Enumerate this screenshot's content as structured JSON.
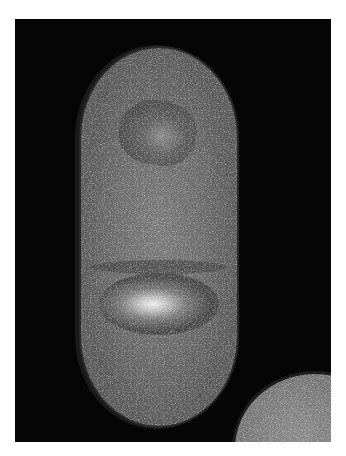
{
  "image": {
    "kind": "grayscale electron micrograph",
    "colors": {
      "border": "#ffffff",
      "background": "#050505",
      "cytoplasm": "#6e6e6e",
      "nucleoid_bright": "#f2f2f2",
      "nucleoid_dark": "#4a4a4a"
    },
    "subjects": [
      {
        "name": "elongated rod-shaped cell",
        "position": "center"
      },
      {
        "name": "partial round cell",
        "position": "bottom-right corner"
      }
    ]
  }
}
